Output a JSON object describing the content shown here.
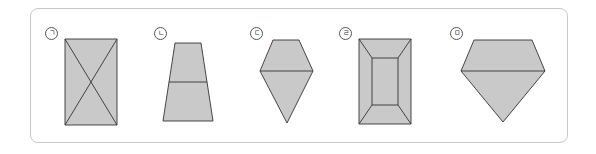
{
  "figure": {
    "fill_color": "#c9c9c9",
    "stroke_color": "#333333",
    "border_color": "#c8c8c8",
    "items": [
      {
        "label": "ㄱ",
        "shape": "rectangle-with-diagonals"
      },
      {
        "label": "ㄴ",
        "shape": "trapezoid-split-horizontal"
      },
      {
        "label": "ㄷ",
        "shape": "kite-hexagon-split"
      },
      {
        "label": "ㄹ",
        "shape": "rectangle-frustum-top-view"
      },
      {
        "label": "ㅁ",
        "shape": "diamond-gem-split"
      }
    ]
  }
}
